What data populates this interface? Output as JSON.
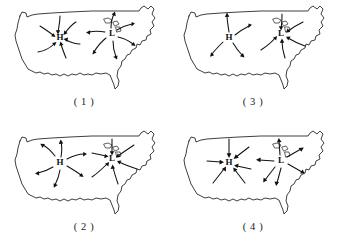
{
  "figure": {
    "title": "",
    "background_color": "#ffffff",
    "ink_color": "#111111",
    "panel_count": 4
  },
  "panels": [
    {
      "id": "panel-1",
      "caption": "( 1 )",
      "position": "top-left",
      "centers": [
        {
          "label": "H",
          "type": "high-pressure-center",
          "x": 60,
          "y": 38,
          "flow": "inward",
          "arrow_style": "curved",
          "arrow_count": 6
        },
        {
          "label": "L",
          "type": "low-pressure-center",
          "x": 112,
          "y": 34,
          "flow": "outward",
          "arrow_style": "curved",
          "arrow_count": 6
        }
      ]
    },
    {
      "id": "panel-2",
      "caption": "( 2 )",
      "position": "bottom-left",
      "centers": [
        {
          "label": "H",
          "type": "high-pressure-center",
          "x": 60,
          "y": 38,
          "flow": "outward",
          "arrow_style": "curved",
          "arrow_count": 6
        },
        {
          "label": "L",
          "type": "low-pressure-center",
          "x": 112,
          "y": 34,
          "flow": "inward",
          "arrow_style": "curved",
          "arrow_count": 6
        }
      ]
    },
    {
      "id": "panel-3",
      "caption": "( 3 )",
      "position": "top-right",
      "centers": [
        {
          "label": "H",
          "type": "high-pressure-center",
          "x": 60,
          "y": 38,
          "flow": "outward",
          "arrow_style": "curved",
          "arrow_count": 4
        },
        {
          "label": "L",
          "type": "low-pressure-center",
          "x": 112,
          "y": 34,
          "flow": "inward",
          "arrow_style": "curved",
          "arrow_count": 5
        }
      ]
    },
    {
      "id": "panel-4",
      "caption": "( 4 )",
      "position": "bottom-right",
      "centers": [
        {
          "label": "H",
          "type": "high-pressure-center",
          "x": 60,
          "y": 38,
          "flow": "inward",
          "arrow_style": "straight",
          "arrow_count": 6
        },
        {
          "label": "L",
          "type": "low-pressure-center",
          "x": 112,
          "y": 36,
          "flow": "outward",
          "arrow_style": "straight",
          "arrow_count": 6
        }
      ]
    }
  ]
}
